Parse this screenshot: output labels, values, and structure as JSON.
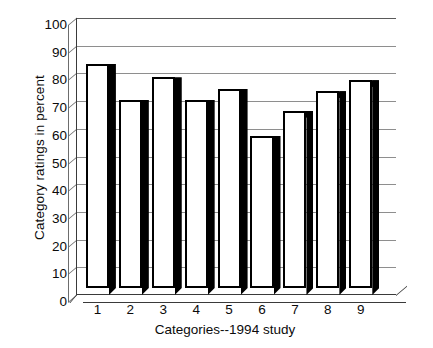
{
  "chart_data": {
    "type": "bar",
    "title": "",
    "xlabel": "Categories--1994 study",
    "ylabel": "Category ratings in percent",
    "categories": [
      "1",
      "2",
      "3",
      "4",
      "5",
      "6",
      "7",
      "8",
      "9"
    ],
    "values": [
      81,
      68,
      76,
      68,
      72,
      55,
      64,
      71,
      75
    ],
    "series": [
      {
        "name": "Category ratings",
        "values": [
          81,
          68,
          76,
          68,
          72,
          55,
          64,
          71,
          75
        ]
      }
    ],
    "ylim": [
      0,
      100
    ],
    "ytick_labels": [
      "0",
      "10",
      "20",
      "30",
      "40",
      "50",
      "60",
      "70",
      "80",
      "90",
      "100"
    ],
    "ytick_values": [
      0,
      10,
      20,
      30,
      40,
      50,
      60,
      70,
      80,
      90,
      100
    ],
    "xtick_labels": [
      "1",
      "2",
      "3",
      "4",
      "5",
      "6",
      "7",
      "8",
      "9"
    ],
    "grid": true,
    "grid_axis": "y",
    "legend": false,
    "legend_position": "none",
    "style": "3d-bar-white-face-black-side",
    "colors": {
      "bar_face": "#ffffff",
      "bar_edge": "#000000",
      "bar_shadow": "#000000",
      "gridline": "#8e8e8e",
      "axis": "#3a3a3a",
      "text": "#0b0b0b",
      "background": "#ffffff"
    }
  },
  "axes": {
    "y_title": "Category ratings in percent",
    "x_title": "Categories--1994 study"
  }
}
